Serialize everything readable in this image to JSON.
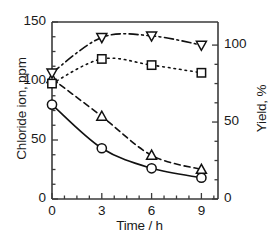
{
  "chart_data": {
    "type": "line",
    "title": "",
    "xlabel": "Time / h",
    "ylabel": "Chloride ion, ppm",
    "y2label": "Yield, %",
    "x": [
      0,
      3,
      6,
      9
    ],
    "xlim": [
      0,
      10
    ],
    "ylim": [
      0,
      150
    ],
    "y2lim": [
      0,
      115
    ],
    "xticks": [
      "0",
      "3",
      "6",
      "9"
    ],
    "yticks": [
      "0",
      "50",
      "100",
      "150"
    ],
    "y2ticks": [
      "0",
      "50",
      "100"
    ],
    "xtick_values": [
      0,
      3,
      6,
      9
    ],
    "ytick_values": [
      0,
      50,
      100,
      150
    ],
    "y2tick_values": [
      0,
      50,
      100
    ],
    "grid": false,
    "legend": "none",
    "series": [
      {
        "name": "chloride-circle",
        "marker": "circle",
        "line": "solid",
        "axis": "left",
        "values": [
          80,
          43,
          26,
          18
        ]
      },
      {
        "name": "chloride-triangle-up",
        "marker": "triangle-up",
        "line": "dashed",
        "axis": "left",
        "values": [
          102,
          70,
          37,
          25
        ]
      },
      {
        "name": "yield-square",
        "marker": "square",
        "line": "dotted",
        "axis": "right",
        "values": [
          75,
          91,
          87,
          82
        ]
      },
      {
        "name": "yield-triangle-down",
        "marker": "triangle-down",
        "line": "dash-dot",
        "axis": "right",
        "values": [
          82,
          105,
          106,
          100
        ]
      }
    ],
    "colors": {
      "axis": "#3a3a3a",
      "line": "#111111",
      "marker_fill": "#ffffff",
      "marker_stroke": "#111111"
    }
  }
}
